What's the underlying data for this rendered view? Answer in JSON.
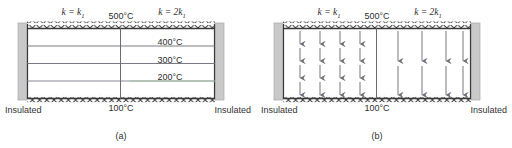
{
  "figure": {
    "title_implicit": "Two-material slab conduction: isotherms and heat flux",
    "panels": [
      {
        "id": "a",
        "caption": "(a)",
        "content_type": "isotherm-map",
        "conductivity_labels": {
          "left": "k = k₁",
          "left_base": "k = k",
          "left_sub": "1",
          "right_base": "k = 2k",
          "right_sub": "1",
          "right": "k = 2k₁"
        },
        "boundaries": {
          "top_label": "500°C",
          "bottom_label": "100°C",
          "left_label": "Insulated",
          "right_label": "Insulated",
          "top_style": "isothermal-hatched",
          "bottom_style": "isothermal-hatched",
          "side_style": "insulated-block"
        },
        "isotherms": [
          {
            "label": "400°C",
            "value": 400,
            "y_frac": 0.25
          },
          {
            "label": "300°C",
            "value": 300,
            "y_frac": 0.5
          },
          {
            "label": "200°C",
            "value": 200,
            "y_frac": 0.75
          }
        ],
        "interface": {
          "present": true,
          "x_frac": 0.5,
          "orientation": "vertical"
        }
      },
      {
        "id": "b",
        "caption": "(b)",
        "content_type": "heat-flux-map",
        "conductivity_labels": {
          "left": "k = k₁",
          "left_base": "k = k",
          "left_sub": "1",
          "right_base": "k = 2k",
          "right_sub": "1",
          "right": "k = 2k₁"
        },
        "boundaries": {
          "top_label": "500°C",
          "bottom_label": "100°C",
          "left_label": "Insulated",
          "right_label": "Insulated",
          "top_style": "isothermal-hatched",
          "bottom_style": "isothermal-hatched",
          "side_style": "insulated-block"
        },
        "flux_arrows": {
          "direction": "down",
          "left_region": {
            "columns": 4,
            "rows": 4,
            "note": "short arrows, k = k1"
          },
          "right_region": {
            "columns": 4,
            "rows": 2,
            "note": "long arrows, k = 2k1"
          }
        },
        "interface": {
          "present": true,
          "x_frac": 0.5,
          "orientation": "vertical"
        }
      }
    ]
  },
  "colors": {
    "line": "#3a3a3a",
    "isotherm": "#6b6b77",
    "insulation_block": "#c9c9c9",
    "insulation_block_edge": "#9d9d9d",
    "arrow": "#6f6f78",
    "text": "#2f2f2f",
    "background": "#ffffff"
  }
}
